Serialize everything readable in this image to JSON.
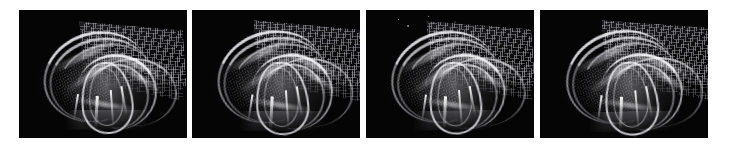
{
  "figure": {
    "name": "four-panel-volume-rendering-sequence",
    "background_color": "#ffffff",
    "panel_background_color": "#050505",
    "panel_count": 4,
    "panel_width_px": 168,
    "panel_height_px": 128,
    "panel_top_px": 10,
    "panel_left_positions_px": [
      19,
      192,
      366,
      540
    ],
    "caption": "",
    "panels": [
      {
        "id": "panel-1",
        "label": "",
        "alt": "Dark rendering of a luminous swept ribbon structure with a dotted mesh sheet at upper right and a faint fan-shaped mesh at left",
        "has_specks": false
      },
      {
        "id": "panel-2",
        "label": "",
        "alt": "Same luminous ribbon structure, slightly rotated camera view with brighter caustic streaks",
        "has_specks": false
      },
      {
        "id": "panel-3",
        "label": "",
        "alt": "Same structure with a few small bright specks near the top of the frame",
        "has_specks": true
      },
      {
        "id": "panel-4",
        "label": "",
        "alt": "Same structure, further rotated, with the mesh sheet extending to the right edge",
        "has_specks": false
      }
    ],
    "elements": {
      "fan_mesh": "faint-dark-fan-mesh",
      "grid_sheet": "dotted-grid-sheet",
      "ribbons": "bright-swept-ribbons",
      "loop": "central-teardrop-loop",
      "spikes": "bright-caustic-spikes",
      "base_plate": "ground-plate"
    },
    "colors": {
      "panel_bg": "#050505",
      "highlight": "#f4f4f8",
      "mesh": "#cdcdd4",
      "page_bg": "#ffffff"
    }
  }
}
